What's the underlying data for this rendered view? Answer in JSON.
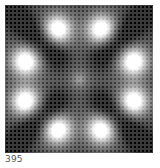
{
  "thumbnail": {
    "description": "moire interference pattern",
    "caption": "395"
  }
}
